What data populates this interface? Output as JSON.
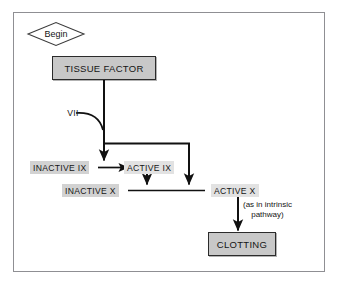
{
  "diagram": {
    "colors": {
      "frame_border": "#8f8f93",
      "box_fill": "#c8c8c8",
      "box_border": "#2b2b2b",
      "highlight_fill": "#d2d2d2",
      "highlight_fill_light": "#e2e2e2",
      "line": "#111111",
      "background": "#ffffff"
    },
    "start": {
      "shape": "diamond",
      "label": "Begin"
    },
    "nodes": [
      {
        "id": "tissue_factor",
        "label": "TISSUE FACTOR",
        "shape": "process-box"
      },
      {
        "id": "inactive_ix",
        "label": "INACTIVE IX",
        "shape": "highlight-label"
      },
      {
        "id": "active_ix",
        "label": "ACTIVE IX",
        "shape": "highlight-label"
      },
      {
        "id": "inactive_x",
        "label": "INACTIVE X",
        "shape": "highlight-label"
      },
      {
        "id": "active_x",
        "label": "ACTIVE X",
        "shape": "highlight-label"
      },
      {
        "id": "clotting",
        "label": "CLOTTING",
        "shape": "process-box"
      }
    ],
    "edge_labels": [
      {
        "id": "factor_vii",
        "label": "VII"
      }
    ],
    "annotations": [
      {
        "id": "intrinsic_note",
        "line1": "(as in intrinsic",
        "line2": "pathway)"
      }
    ]
  }
}
